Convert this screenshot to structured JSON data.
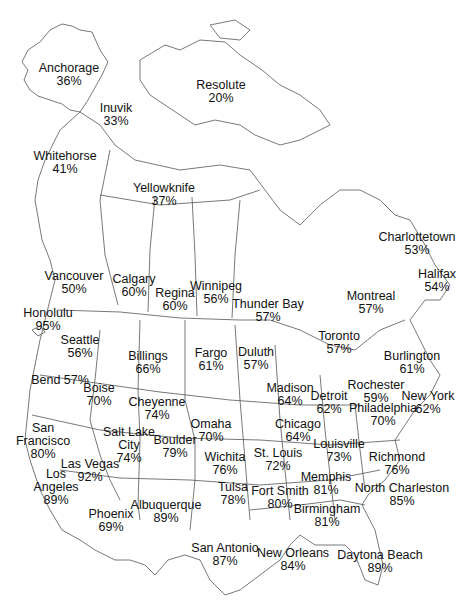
{
  "map": {
    "type": "labeled-city-map",
    "region": "North America (Alaska, Canada, contiguous US, Hawaii)",
    "line_color": "#555555",
    "text_color": "#111111",
    "background": "#ffffff"
  },
  "cities": [
    {
      "name": "Anchorage",
      "value": "36%",
      "x": 69,
      "y": 62
    },
    {
      "name": "Resolute",
      "value": "20%",
      "x": 221,
      "y": 79
    },
    {
      "name": "Inuvik",
      "value": "33%",
      "x": 116,
      "y": 102
    },
    {
      "name": "Whitehorse",
      "value": "41%",
      "x": 65,
      "y": 150
    },
    {
      "name": "Yellowknife",
      "value": "37%",
      "x": 164,
      "y": 182
    },
    {
      "name": "Charlottetown",
      "value": "53%",
      "x": 417,
      "y": 231
    },
    {
      "name": "Halifax",
      "value": "54%",
      "x": 437,
      "y": 268
    },
    {
      "name": "Vancouver",
      "value": "50%",
      "x": 74,
      "y": 270
    },
    {
      "name": "Calgary",
      "value": "60%",
      "x": 134,
      "y": 273
    },
    {
      "name": "Regina",
      "value": "60%",
      "x": 175,
      "y": 287
    },
    {
      "name": "Winnipeg",
      "value": "56%",
      "x": 216,
      "y": 280
    },
    {
      "name": "Thunder Bay",
      "value": "57%",
      "x": 268,
      "y": 298
    },
    {
      "name": "Montreal",
      "value": "57%",
      "x": 371,
      "y": 290
    },
    {
      "name": "Honolulu",
      "value": "95%",
      "x": 48,
      "y": 307
    },
    {
      "name": "Toronto",
      "value": "57%",
      "x": 339,
      "y": 330
    },
    {
      "name": "Seattle",
      "value": "56%",
      "x": 80,
      "y": 334
    },
    {
      "name": "Billings",
      "value": "66%",
      "x": 148,
      "y": 350
    },
    {
      "name": "Fargo",
      "value": "61%",
      "x": 211,
      "y": 347
    },
    {
      "name": "Duluth",
      "value": "57%",
      "x": 256,
      "y": 346
    },
    {
      "name": "Burlington",
      "value": "61%",
      "x": 412,
      "y": 350
    },
    {
      "name": "Bend",
      "value": "57%",
      "x": 60,
      "y": 374,
      "inline": true
    },
    {
      "name": "Boise",
      "value": "70%",
      "x": 99,
      "y": 382
    },
    {
      "name": "Madison",
      "value": "64%",
      "x": 290,
      "y": 382
    },
    {
      "name": "Rochester",
      "value": "59%",
      "x": 376,
      "y": 379
    },
    {
      "name": "Detroit",
      "value": "62%",
      "x": 329,
      "y": 390
    },
    {
      "name": "New York",
      "value": "62%",
      "x": 428,
      "y": 390
    },
    {
      "name": "Cheyenne",
      "value": "74%",
      "x": 157,
      "y": 396
    },
    {
      "name": "Philadelphia",
      "value": "70%",
      "x": 383,
      "y": 402
    },
    {
      "name": "Chicago",
      "value": "64%",
      "x": 298,
      "y": 418
    },
    {
      "name": "Omaha",
      "value": "70%",
      "x": 211,
      "y": 418
    },
    {
      "name": "San Francisco",
      "value": "80%",
      "x": 43,
      "y": 422,
      "lines": [
        "San",
        "Francisco"
      ]
    },
    {
      "name": "Salt Lake City",
      "value": "74%",
      "x": 129,
      "y": 426,
      "lines": [
        "Salt Lake",
        "City"
      ]
    },
    {
      "name": "Boulder",
      "value": "79%",
      "x": 175,
      "y": 434
    },
    {
      "name": "Louisville",
      "value": "73%",
      "x": 339,
      "y": 438
    },
    {
      "name": "St. Louis",
      "value": "72%",
      "x": 278,
      "y": 447
    },
    {
      "name": "Wichita",
      "value": "76%",
      "x": 225,
      "y": 451
    },
    {
      "name": "Richmond",
      "value": "76%",
      "x": 397,
      "y": 451
    },
    {
      "name": "Las Vegas",
      "value": "92%",
      "x": 90,
      "y": 458
    },
    {
      "name": "Memphis",
      "value": "81%",
      "x": 326,
      "y": 471
    },
    {
      "name": "North Charleston",
      "value": "85%",
      "x": 402,
      "y": 482
    },
    {
      "name": "Los Angeles",
      "value": "89%",
      "x": 56,
      "y": 468,
      "lines": [
        "Los",
        "Angeles"
      ]
    },
    {
      "name": "Tulsa",
      "value": "78%",
      "x": 233,
      "y": 481
    },
    {
      "name": "Fort Smith",
      "value": "80%",
      "x": 280,
      "y": 485
    },
    {
      "name": "Albuquerque",
      "value": "89%",
      "x": 166,
      "y": 499
    },
    {
      "name": "Phoenix",
      "value": "69%",
      "x": 111,
      "y": 508
    },
    {
      "name": "Birmingham",
      "value": "81%",
      "x": 327,
      "y": 503
    },
    {
      "name": "San Antonio",
      "value": "87%",
      "x": 225,
      "y": 542
    },
    {
      "name": "New Orleans",
      "value": "84%",
      "x": 293,
      "y": 547
    },
    {
      "name": "Daytona Beach",
      "value": "89%",
      "x": 380,
      "y": 549
    }
  ]
}
